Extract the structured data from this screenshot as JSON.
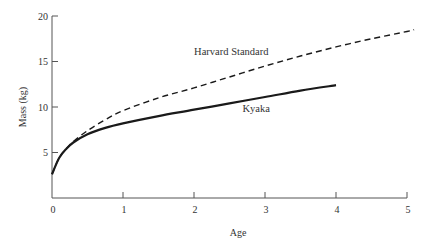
{
  "chart_data": {
    "type": "line",
    "title": "",
    "xlabel": "Age",
    "ylabel": "Mass (kg)",
    "xlim": [
      0,
      5
    ],
    "ylim": [
      0,
      20
    ],
    "xticks": [
      0,
      1,
      2,
      3,
      4,
      5
    ],
    "yticks": [
      5,
      10,
      15,
      20
    ],
    "xtick_labels": [
      "0",
      "1",
      "2",
      "3",
      "4",
      "5"
    ],
    "ytick_labels": [
      "5",
      "10",
      "15",
      "20"
    ],
    "grid": false,
    "legend": "inline labels",
    "series": [
      {
        "name": "Harvard Standard",
        "style": "dashed",
        "x": [
          0,
          0.1,
          0.2,
          0.3,
          0.5,
          0.75,
          1,
          1.5,
          2,
          2.5,
          3,
          3.5,
          4,
          4.5,
          5,
          5.1
        ],
        "y": [
          2.6,
          4.4,
          5.4,
          6.2,
          7.4,
          8.6,
          9.6,
          11.0,
          12.1,
          13.3,
          14.5,
          15.6,
          16.6,
          17.5,
          18.3,
          18.5
        ]
      },
      {
        "name": "Kyaka",
        "style": "solid",
        "x": [
          0,
          0.1,
          0.2,
          0.3,
          0.5,
          0.75,
          1,
          1.5,
          2,
          2.5,
          3,
          3.5,
          4
        ],
        "y": [
          2.6,
          4.4,
          5.4,
          6.1,
          7.0,
          7.7,
          8.2,
          9.0,
          9.7,
          10.4,
          11.1,
          11.8,
          12.4
        ]
      }
    ],
    "annotations": [
      {
        "text": "Harvard Standard",
        "x": 2.3,
        "y": 16.2
      },
      {
        "text": "Kyaka",
        "x": 2.65,
        "y": 9.9
      }
    ]
  }
}
